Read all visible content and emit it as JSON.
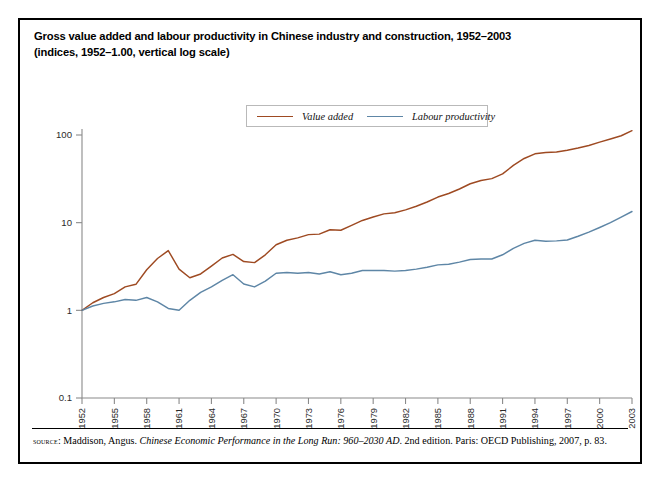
{
  "figure": {
    "title_line1": "Gross value added and labour productivity in Chinese industry and construction, 1952–2003",
    "title_line2": "(indices, 1952–1.00, vertical log scale)"
  },
  "legend": {
    "position": "top-center",
    "entries": [
      {
        "label": "Value added",
        "color": "#9e4a22"
      },
      {
        "label": "Labour productivity",
        "color": "#5e86a6"
      }
    ]
  },
  "source": {
    "kicker": "source",
    "text_before_title": ": Maddison, Angus. ",
    "work_title": "Chinese Economic Performance in the Long Run: 960–2030 AD",
    "text_after_title": ". 2nd edition. Paris: OECD Publishing, 2007, p. 83."
  },
  "chart_data": {
    "type": "line",
    "title": "Gross value added and labour productivity in Chinese industry and construction, 1952–2003",
    "subtitle": "(indices, 1952–1.00, vertical log scale)",
    "xlabel": "",
    "ylabel": "",
    "yscale": "log",
    "ylim": [
      0.1,
      100
    ],
    "ytick_labels": [
      "100",
      "10",
      "1",
      "0.1"
    ],
    "ytick_values": [
      100,
      10,
      1,
      0.1
    ],
    "xlim": [
      1952,
      2003
    ],
    "xtick_labels": [
      "1952",
      "1955",
      "1958",
      "1961",
      "1964",
      "1967",
      "1970",
      "1973",
      "1976",
      "1979",
      "1982",
      "1985",
      "1988",
      "1991",
      "1994",
      "1997",
      "2000",
      "2003"
    ],
    "xtick_values": [
      1952,
      1955,
      1958,
      1961,
      1964,
      1967,
      1970,
      1973,
      1976,
      1979,
      1982,
      1985,
      1988,
      1991,
      1994,
      1997,
      2000,
      2003
    ],
    "grid": false,
    "legend_position": "top-center",
    "x": [
      1952,
      1953,
      1954,
      1955,
      1956,
      1957,
      1958,
      1959,
      1960,
      1961,
      1962,
      1963,
      1964,
      1965,
      1966,
      1967,
      1968,
      1969,
      1970,
      1971,
      1972,
      1973,
      1974,
      1975,
      1976,
      1977,
      1978,
      1979,
      1980,
      1981,
      1982,
      1983,
      1984,
      1985,
      1986,
      1987,
      1988,
      1989,
      1990,
      1991,
      1992,
      1993,
      1994,
      1995,
      1996,
      1997,
      1998,
      1999,
      2000,
      2001,
      2002,
      2003
    ],
    "series": [
      {
        "name": "Value added",
        "color": "#9e4a22",
        "values": [
          1.0,
          1.22,
          1.4,
          1.55,
          1.85,
          1.98,
          2.9,
          3.9,
          4.8,
          2.95,
          2.35,
          2.6,
          3.2,
          3.95,
          4.35,
          3.6,
          3.5,
          4.3,
          5.6,
          6.3,
          6.7,
          7.3,
          7.4,
          8.3,
          8.2,
          9.3,
          10.6,
          11.6,
          12.6,
          13.0,
          14.0,
          15.4,
          17.2,
          19.6,
          21.5,
          24.2,
          27.8,
          30.3,
          31.8,
          36.0,
          45.0,
          54.0,
          61.0,
          63.0,
          64.0,
          67.0,
          71.0,
          76.0,
          83.0,
          90.0,
          98.0,
          112.0
        ]
      },
      {
        "name": "Labour productivity",
        "color": "#5e86a6",
        "values": [
          1.0,
          1.12,
          1.2,
          1.25,
          1.33,
          1.3,
          1.4,
          1.25,
          1.05,
          1.0,
          1.3,
          1.6,
          1.85,
          2.2,
          2.55,
          2.0,
          1.85,
          2.15,
          2.65,
          2.7,
          2.65,
          2.7,
          2.6,
          2.75,
          2.55,
          2.65,
          2.85,
          2.85,
          2.85,
          2.8,
          2.85,
          2.95,
          3.1,
          3.3,
          3.35,
          3.55,
          3.8,
          3.85,
          3.85,
          4.3,
          5.1,
          5.8,
          6.3,
          6.15,
          6.2,
          6.35,
          7.0,
          7.8,
          8.8,
          10.0,
          11.6,
          13.4
        ]
      }
    ]
  }
}
